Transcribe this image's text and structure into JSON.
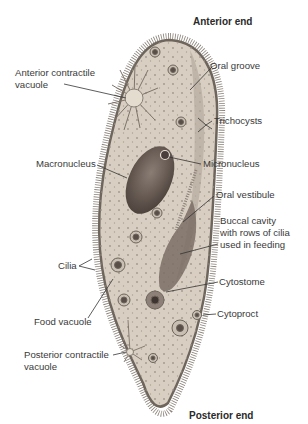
{
  "diagram": {
    "colors": {
      "background": "#ffffff",
      "body_fill": "#d8cfc2",
      "body_edge": "#6e655c",
      "cilia": "#7a7068",
      "nucleus": "#6b5e56",
      "label_text": "#3a3a3a"
    },
    "labels": {
      "anterior_end": "Anterior end",
      "posterior_end": "Posterior end",
      "anterior_contractile_vacuole": [
        "Anterior contractile",
        "vacuole"
      ],
      "oral_groove": "Oral groove",
      "trichocysts": "Trichocysts",
      "macronucleus": "Macronucleus",
      "micronucleus": "Micronucleus",
      "oral_vestibule": "Oral vestibule",
      "buccal_cavity": [
        "Buccal cavity",
        "with rows of cilia",
        "used in feeding"
      ],
      "cilia": "Cilia",
      "cytostome": "Cytostome",
      "food_vacuole": "Food vacuole",
      "cytoproct": "Cytoproct",
      "posterior_contractile_vacuole": [
        "Posterior contractile",
        "vacuole"
      ]
    }
  }
}
